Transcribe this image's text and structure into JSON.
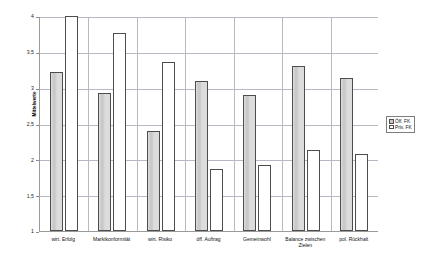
{
  "chart_data": {
    "type": "bar",
    "title": "",
    "subtitle": "",
    "xlabel": "",
    "ylabel": "Mittelwerte",
    "ylim": [
      1,
      4
    ],
    "ytick_labels": [
      "4",
      "3,5",
      "3",
      "2,5",
      "2",
      "1,5",
      "1"
    ],
    "ytick_values": [
      4,
      3.5,
      3,
      2.5,
      2,
      1.5,
      1
    ],
    "grid": true,
    "legend_position": "right",
    "categories": [
      "wirt. Erfolg",
      "Marktkonformität",
      "wirt. Risiko",
      "öff. Auftrag",
      "Gemeinwohl",
      "Balance zwischen Zielen",
      "pol. Rückhalt"
    ],
    "series": [
      {
        "name": "Öff. FK",
        "color": "#c9c9c9",
        "values": [
          3.22,
          2.92,
          2.39,
          3.1,
          2.9,
          3.3,
          3.13
        ]
      },
      {
        "name": "Priv. FK",
        "color": "#ffffff",
        "values": [
          4.0,
          3.76,
          3.36,
          1.87,
          1.92,
          2.13,
          2.08
        ]
      }
    ]
  },
  "legend": {
    "items": [
      {
        "label": "Öff. FK"
      },
      {
        "label": "Priv. FK"
      }
    ]
  }
}
